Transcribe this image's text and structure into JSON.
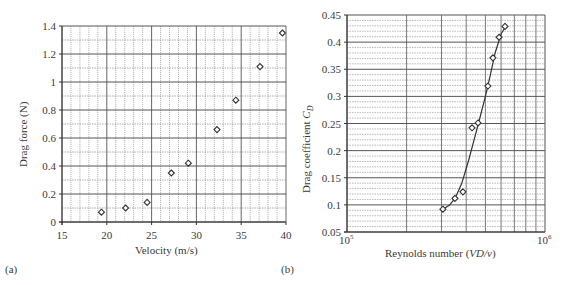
{
  "chart_data": [
    {
      "panel": "(a)",
      "type": "scatter",
      "title": "",
      "xlabel": "Velocity (m/s)",
      "ylabel": "Drag force (N)",
      "xlim": [
        15,
        40
      ],
      "ylim": [
        0,
        1.4
      ],
      "xticks": [
        15,
        20,
        25,
        30,
        35,
        40
      ],
      "xtick_labels": [
        "15",
        "20",
        "25",
        "30",
        "35",
        "40"
      ],
      "yticks": [
        0,
        0.2,
        0.4,
        0.6,
        0.8,
        1,
        1.2,
        1.4
      ],
      "ytick_labels": [
        "0",
        "0.2",
        "0.4",
        "0.6",
        "0.8",
        "1",
        "1.2",
        "1.4"
      ],
      "grid": true,
      "marker": "diamond-open",
      "x": [
        19.4,
        22.1,
        24.5,
        27.2,
        29.1,
        32.3,
        34.4,
        37.1,
        39.6
      ],
      "y": [
        0.07,
        0.1,
        0.14,
        0.35,
        0.42,
        0.66,
        0.87,
        1.11,
        1.35
      ]
    },
    {
      "panel": "(b)",
      "type": "scatter",
      "title": "",
      "xlabel": "Reynolds number (VD/v)",
      "ylabel": "Drag coefficient C_D",
      "xscale": "log",
      "xlim": [
        100000,
        1000000
      ],
      "ylim": [
        0.05,
        0.45
      ],
      "xticks": [
        100000,
        1000000
      ],
      "xtick_labels": [
        "10^5",
        "10^6"
      ],
      "yticks": [
        0.05,
        0.1,
        0.15,
        0.2,
        0.25,
        0.3,
        0.35,
        0.4,
        0.45
      ],
      "ytick_labels": [
        "0.05",
        "0.1",
        "0.15",
        "0.2",
        "0.25",
        "0.3",
        "0.35",
        "0.4",
        "0.45"
      ],
      "grid": true,
      "marker": "diamond-open",
      "x": [
        305000,
        351000,
        385000,
        428000,
        459000,
        515000,
        546000,
        586000,
        628000
      ],
      "y": [
        0.092,
        0.112,
        0.124,
        0.242,
        0.251,
        0.319,
        0.371,
        0.409,
        0.429
      ],
      "fit_curve": {
        "x": [
          305000,
          330000,
          351000,
          380000,
          410000,
          440000,
          470000,
          500000,
          530000,
          560000,
          600000,
          640000
        ],
        "y": [
          0.092,
          0.1,
          0.112,
          0.14,
          0.18,
          0.222,
          0.262,
          0.3,
          0.34,
          0.38,
          0.415,
          0.432
        ]
      }
    }
  ],
  "labels": {
    "panel_a": "(a)",
    "panel_b": "(b)",
    "a_xlabel": "Velocity (m/s)",
    "a_ylabel": "Drag force (N)",
    "b_xlabel_pre": "Reynolds number (",
    "b_xlabel_italic": "VD/v",
    "b_xlabel_post": ")",
    "b_ylabel_pre": "Drag coefficient ",
    "b_ylabel_italic": "C",
    "b_ylabel_sub": "D",
    "b_x_min_base": "10",
    "b_x_min_exp": "5",
    "b_x_max_base": "10",
    "b_x_max_exp": "6"
  },
  "colors": {
    "major_grid": "#555555",
    "minor_grid": "#8a8a8a",
    "marker": "#333333",
    "text": "#3a3a3a"
  }
}
